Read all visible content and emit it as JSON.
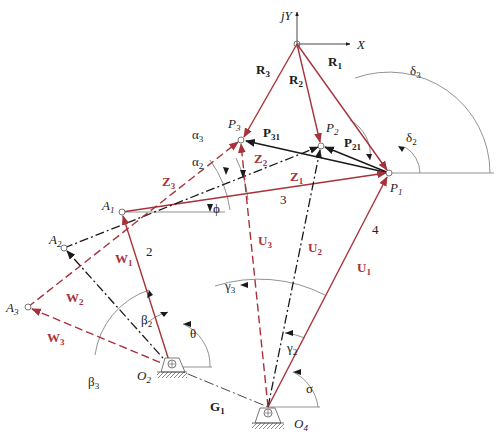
{
  "figure": {
    "colors": {
      "red": "#a8323a",
      "black": "#1a1a1a",
      "gray": "#777777"
    },
    "axes": {
      "y_label": "jY",
      "x_label": "X"
    },
    "points": {
      "P1": {
        "label": "P",
        "sub": "1"
      },
      "P2": {
        "label": "P",
        "sub": "2"
      },
      "P3": {
        "label": "P",
        "sub": "3"
      },
      "A1": {
        "label": "A",
        "sub": "1"
      },
      "A2": {
        "label": "A",
        "sub": "2"
      },
      "A3": {
        "label": "A",
        "sub": "3"
      },
      "O2": {
        "label": "O",
        "sub": "2"
      },
      "O4": {
        "label": "O",
        "sub": "4"
      }
    },
    "vectors": {
      "R1": {
        "label": "R",
        "sub": "1"
      },
      "R2": {
        "label": "R",
        "sub": "2"
      },
      "R3": {
        "label": "R",
        "sub": "3"
      },
      "P21": {
        "label": "P",
        "sub": "21"
      },
      "P31": {
        "label": "P",
        "sub": "31"
      },
      "Z1": {
        "label": "Z",
        "sub": "1"
      },
      "Z2": {
        "label": "Z",
        "sub": "2"
      },
      "Z3": {
        "label": "Z",
        "sub": "3"
      },
      "W1": {
        "label": "W",
        "sub": "1"
      },
      "W2": {
        "label": "W",
        "sub": "2"
      },
      "W3": {
        "label": "W",
        "sub": "3"
      },
      "U1": {
        "label": "U",
        "sub": "1"
      },
      "U2": {
        "label": "U",
        "sub": "2"
      },
      "U3": {
        "label": "U",
        "sub": "3"
      },
      "G1": {
        "label": "G",
        "sub": "1"
      }
    },
    "angles": {
      "delta2": {
        "label": "δ",
        "sub": "2"
      },
      "delta3": {
        "label": "δ",
        "sub": "3"
      },
      "alpha2": {
        "label": "α",
        "sub": "2"
      },
      "alpha3": {
        "label": "α",
        "sub": "3"
      },
      "phi": {
        "label": "ϕ"
      },
      "beta2": {
        "label": "β",
        "sub": "2"
      },
      "beta3": {
        "label": "β",
        "sub": "3"
      },
      "gamma2": {
        "label": "γ",
        "sub": "2"
      },
      "gamma3": {
        "label": "γ",
        "sub": "3"
      },
      "theta": {
        "label": "θ"
      },
      "sigma": {
        "label": "σ"
      }
    },
    "links": {
      "link2": "2",
      "link3": "3",
      "link4": "4"
    }
  }
}
